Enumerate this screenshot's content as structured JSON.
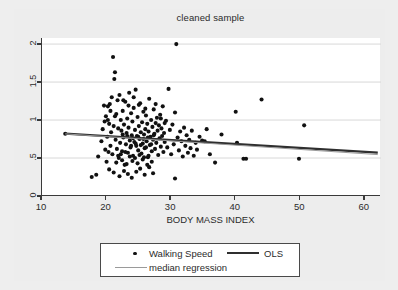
{
  "chart_data": {
    "type": "scatter",
    "title": "cleaned sample",
    "xlabel": "BODY MASS INDEX",
    "ylabel": "",
    "xlim": [
      10,
      62.5
    ],
    "ylim": [
      0,
      2.08
    ],
    "xticks": [
      "10",
      "20",
      "30",
      "40",
      "50",
      "60"
    ],
    "xtick_values": [
      10,
      20,
      30,
      40,
      50,
      60
    ],
    "yticks": [
      "0",
      ".5",
      "1",
      "1.5",
      "2"
    ],
    "ytick_values": [
      0,
      0.5,
      1,
      1.5,
      2
    ],
    "grid": "horizontal",
    "legend_position": "below-plot",
    "series": [
      {
        "name": "Walking Speed",
        "type": "scatter",
        "marker": "filled-circle",
        "color": "#111111",
        "points": [
          [
            13.6,
            0.82
          ],
          [
            17.7,
            0.25
          ],
          [
            18.4,
            0.28
          ],
          [
            18.7,
            0.52
          ],
          [
            19.2,
            0.72
          ],
          [
            19.4,
            0.88
          ],
          [
            19.6,
            1.19
          ],
          [
            19.8,
            0.61
          ],
          [
            19.9,
            1.05
          ],
          [
            20.0,
            0.45
          ],
          [
            20.1,
            0.78
          ],
          [
            20.2,
            1.18
          ],
          [
            20.3,
            0.58
          ],
          [
            20.4,
            0.95
          ],
          [
            20.5,
            1.21
          ],
          [
            20.6,
            0.66
          ],
          [
            20.7,
            0.84
          ],
          [
            20.8,
            1.3
          ],
          [
            20.9,
            0.55
          ],
          [
            21.0,
            1.83
          ],
          [
            21.1,
            0.92
          ],
          [
            21.2,
            1.54
          ],
          [
            21.3,
            1.63
          ],
          [
            21.4,
            0.74
          ],
          [
            21.5,
            1.08
          ],
          [
            21.6,
            0.62
          ],
          [
            21.7,
            1.26
          ],
          [
            21.8,
            0.89
          ],
          [
            21.9,
            0.5
          ],
          [
            22.0,
            1.33
          ],
          [
            22.1,
            0.7
          ],
          [
            22.2,
            1.0
          ],
          [
            22.3,
            0.86
          ],
          [
            22.4,
            0.59
          ],
          [
            22.5,
            1.12
          ],
          [
            22.6,
            0.77
          ],
          [
            22.7,
            0.94
          ],
          [
            22.8,
            0.41
          ],
          [
            22.9,
            1.24
          ],
          [
            23.0,
            0.68
          ],
          [
            23.1,
            0.83
          ],
          [
            23.2,
            1.02
          ],
          [
            23.3,
            0.57
          ],
          [
            23.4,
            0.9
          ],
          [
            23.5,
            1.36
          ],
          [
            23.6,
            0.73
          ],
          [
            23.7,
            0.64
          ],
          [
            23.8,
            1.09
          ],
          [
            23.9,
            0.8
          ],
          [
            24.0,
            0.98
          ],
          [
            24.1,
            0.53
          ],
          [
            24.2,
            1.16
          ],
          [
            24.3,
            0.71
          ],
          [
            24.4,
            0.87
          ],
          [
            24.5,
            1.4
          ],
          [
            24.6,
            0.66
          ],
          [
            24.7,
            0.79
          ],
          [
            24.8,
            1.04
          ],
          [
            24.9,
            0.6
          ],
          [
            25.0,
            0.92
          ],
          [
            25.1,
            0.75
          ],
          [
            25.2,
            1.22
          ],
          [
            25.3,
            0.84
          ],
          [
            25.4,
            0.56
          ],
          [
            25.5,
            0.97
          ],
          [
            25.6,
            0.69
          ],
          [
            25.7,
            1.11
          ],
          [
            25.8,
            0.81
          ],
          [
            25.9,
            0.63
          ],
          [
            26.0,
            0.88
          ],
          [
            26.1,
            1.06
          ],
          [
            26.2,
            0.72
          ],
          [
            26.3,
            0.95
          ],
          [
            26.4,
            0.51
          ],
          [
            26.5,
            0.85
          ],
          [
            26.6,
            1.28
          ],
          [
            26.7,
            0.67
          ],
          [
            26.8,
            0.78
          ],
          [
            26.9,
            1.0
          ],
          [
            27.0,
            0.59
          ],
          [
            27.1,
            0.91
          ],
          [
            27.2,
            0.74
          ],
          [
            27.3,
            1.14
          ],
          [
            27.4,
            0.82
          ],
          [
            27.5,
            0.62
          ],
          [
            27.6,
            0.96
          ],
          [
            27.7,
            0.7
          ],
          [
            27.8,
            1.03
          ],
          [
            27.9,
            0.86
          ],
          [
            28.0,
            0.54
          ],
          [
            28.1,
            0.93
          ],
          [
            28.2,
            0.76
          ],
          [
            28.3,
            1.07
          ],
          [
            28.4,
            0.65
          ],
          [
            28.5,
            0.89
          ],
          [
            28.6,
            0.79
          ],
          [
            28.7,
            1.18
          ],
          [
            28.8,
            0.58
          ],
          [
            28.9,
            0.83
          ],
          [
            29.0,
            0.71
          ],
          [
            29.2,
            0.99
          ],
          [
            29.4,
            0.64
          ],
          [
            29.6,
            1.41
          ],
          [
            29.8,
            0.87
          ],
          [
            30.0,
            0.55
          ],
          [
            30.2,
            0.94
          ],
          [
            30.4,
            0.68
          ],
          [
            30.6,
            1.1
          ],
          [
            30.8,
            2.0
          ],
          [
            31.0,
            0.77
          ],
          [
            31.2,
            0.6
          ],
          [
            31.4,
            0.85
          ],
          [
            31.6,
            0.72
          ],
          [
            31.8,
            0.52
          ],
          [
            32.0,
            0.9
          ],
          [
            32.2,
            0.66
          ],
          [
            32.4,
            0.8
          ],
          [
            32.6,
            0.57
          ],
          [
            32.8,
            0.74
          ],
          [
            33.0,
            0.63
          ],
          [
            33.2,
            0.86
          ],
          [
            33.5,
            0.53
          ],
          [
            33.8,
            0.7
          ],
          [
            34.0,
            0.61
          ],
          [
            34.4,
            0.78
          ],
          [
            34.8,
            0.73
          ],
          [
            35.2,
            0.72
          ],
          [
            35.5,
            0.88
          ],
          [
            36.0,
            0.55
          ],
          [
            36.8,
            0.44
          ],
          [
            37.8,
            0.81
          ],
          [
            40.0,
            1.11
          ],
          [
            40.2,
            0.7
          ],
          [
            41.2,
            0.49
          ],
          [
            41.6,
            0.49
          ],
          [
            44.0,
            1.27
          ],
          [
            49.8,
            0.49
          ],
          [
            50.6,
            0.93
          ],
          [
            20.4,
            0.35
          ],
          [
            21.1,
            0.31
          ],
          [
            22.0,
            0.26
          ],
          [
            22.7,
            0.33
          ],
          [
            23.3,
            0.29
          ],
          [
            23.9,
            0.24
          ],
          [
            24.6,
            0.32
          ],
          [
            25.2,
            0.36
          ],
          [
            25.9,
            0.28
          ],
          [
            26.6,
            0.38
          ],
          [
            27.2,
            0.3
          ],
          [
            30.6,
            0.23
          ],
          [
            21.5,
            0.44
          ],
          [
            22.4,
            0.47
          ],
          [
            23.1,
            0.42
          ],
          [
            24.0,
            0.46
          ],
          [
            24.8,
            0.43
          ],
          [
            25.6,
            0.48
          ],
          [
            26.3,
            0.41
          ],
          [
            27.0,
            0.45
          ],
          [
            23.6,
            0.52
          ],
          [
            24.4,
            0.5
          ],
          [
            25.1,
            0.54
          ],
          [
            25.8,
            0.51
          ],
          [
            26.5,
            0.53
          ],
          [
            22.2,
            0.55
          ],
          [
            22.9,
            0.58
          ],
          [
            21.8,
            0.53
          ],
          [
            24.2,
            1.3
          ],
          [
            25.0,
            1.2
          ],
          [
            26.0,
            1.15
          ],
          [
            22.6,
            1.26
          ],
          [
            23.4,
            1.19
          ],
          [
            20.6,
            1.12
          ],
          [
            21.3,
            1.05
          ],
          [
            27.6,
            1.21
          ],
          [
            28.4,
            1.02
          ],
          [
            29.0,
            0.96
          ],
          [
            19.7,
            0.98
          ],
          [
            20.2,
            1.0
          ],
          [
            23.8,
            0.66
          ],
          [
            24.5,
            0.69
          ],
          [
            25.3,
            0.67
          ],
          [
            26.1,
            0.64
          ],
          [
            26.9,
            0.68
          ],
          [
            24.1,
            0.76
          ],
          [
            24.9,
            0.78
          ],
          [
            25.7,
            0.75
          ],
          [
            26.4,
            0.77
          ],
          [
            23.2,
            0.79
          ],
          [
            22.5,
            0.81
          ],
          [
            27.3,
            0.8
          ]
        ]
      },
      {
        "name": "OLS",
        "type": "line",
        "style": "thick",
        "color": "#2f2f2f",
        "endpoints": [
          [
            13.6,
            0.82
          ],
          [
            62.0,
            0.572
          ]
        ]
      },
      {
        "name": "median regression",
        "type": "line",
        "style": "thin",
        "color": "#9a9a9a",
        "endpoints": [
          [
            13.6,
            0.818
          ],
          [
            62.0,
            0.545
          ]
        ]
      }
    ]
  },
  "legend": {
    "items": [
      {
        "label": "Walking Speed",
        "marker": "dot"
      },
      {
        "label": "OLS",
        "marker": "thick-line"
      },
      {
        "label": "median regression",
        "marker": "thin-line"
      }
    ]
  }
}
